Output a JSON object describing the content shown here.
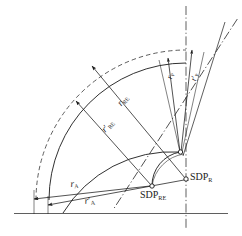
{
  "figure": {
    "type": "technical-geometry-diagram",
    "background_color": "#ffffff",
    "line_color": "#1a1a1a",
    "dashed_arc_color": "#555555"
  },
  "points": [
    {
      "id": "sdp-r",
      "base": "SDP",
      "subscript": "R",
      "x": 186,
      "y": 179,
      "marker": "open-circle"
    },
    {
      "id": "sdp-re",
      "base": "SDP",
      "subscript": "RE",
      "x": 152,
      "y": 186,
      "marker": "open-circle"
    },
    {
      "id": "sdp-upper",
      "base": "",
      "subscript": "",
      "x": 180,
      "y": 152,
      "marker": "open-circle"
    }
  ],
  "labels": {
    "sdp_r": {
      "base": "SDP",
      "sub": "R"
    },
    "sdp_re": {
      "base": "SDP",
      "sub": "RE"
    },
    "r_a": {
      "base": "r",
      "sub": "A",
      "prime": false
    },
    "r_a_prime": {
      "base": "r",
      "sub": "A",
      "prime": true
    },
    "r_re": {
      "base": "r",
      "sub": "RE",
      "prime": false
    },
    "r_re_prime": {
      "base": "r",
      "sub": "RE",
      "prime": true
    },
    "r_p": {
      "base": "r",
      "sub": "P",
      "prime": false
    },
    "r_p_prime": {
      "base": "r",
      "sub": "P",
      "prime": true
    }
  },
  "arcs": [
    {
      "name": "outer-dashed-arc",
      "style": "dashed",
      "radius": 150,
      "center_x": 186,
      "center_y": 200
    },
    {
      "name": "outer-solid-arc",
      "style": "solid",
      "radius": 137,
      "center_x": 186,
      "center_y": 200
    },
    {
      "name": "middle-solid-arc",
      "style": "solid",
      "radius": 110,
      "center_x": 186,
      "center_y": 200
    },
    {
      "name": "inner-small-arc",
      "style": "solid",
      "radius": 35,
      "center_x": 186,
      "center_y": 186
    }
  ],
  "axes": {
    "horizontal_baseline": {
      "style": "solid",
      "y": 213
    },
    "vertical_centerline": {
      "style": "dash-dot",
      "x": 186
    },
    "radial_centerline": {
      "style": "dash-dot"
    }
  },
  "dimension_arrows": [
    {
      "name": "r-a-arrow",
      "label": "r_a",
      "direction": "double",
      "from": "sdp-re",
      "to": "middle-solid-arc"
    },
    {
      "name": "r-a-prime-arrow",
      "label": "r_a_prime",
      "direction": "double",
      "from": "sdp-r",
      "to": "outer-dashed-arc"
    },
    {
      "name": "r-re-arrow",
      "label": "r_re",
      "direction": "single",
      "from": "sdp-r",
      "to": "outer-solid-arc"
    },
    {
      "name": "r-re-prime-arrow",
      "label": "r_re_prime",
      "direction": "single",
      "from": "sdp-re",
      "to": "middle-solid-arc"
    },
    {
      "name": "r-p-arrow",
      "label": "r_p",
      "direction": "single",
      "from": "sdp-upper",
      "to": "outer-solid-arc"
    },
    {
      "name": "r-p-prime-arrow",
      "label": "r_p_prime",
      "direction": "single",
      "from": "sdp-r",
      "to": "outer-dashed-arc"
    }
  ]
}
